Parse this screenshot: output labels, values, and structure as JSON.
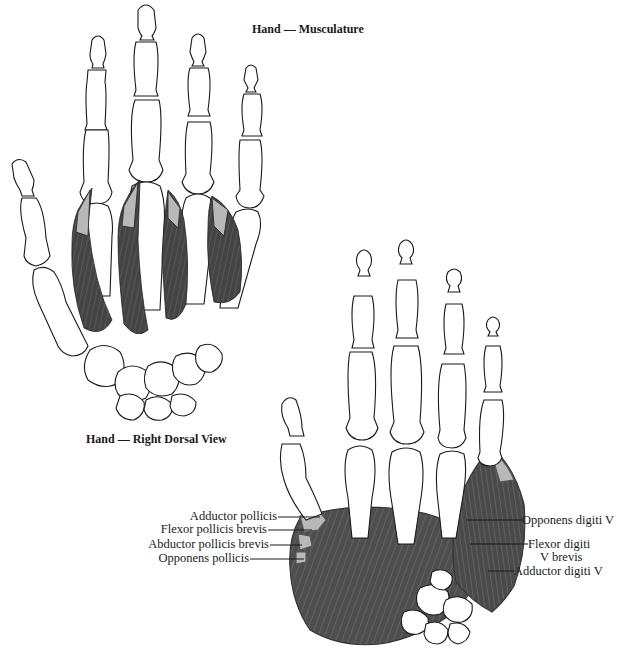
{
  "figure_title": "Hand — Musculature",
  "dorsal_view": {
    "caption": "Hand — Right Dorsal View"
  },
  "palmar_view": {
    "labels_left": [
      {
        "text": "Adductor pollicis"
      },
      {
        "text": "Flexor pollicis brevis"
      },
      {
        "text": "Abductor pollicis brevis"
      },
      {
        "text": "Opponens pollicis"
      }
    ],
    "labels_right": [
      {
        "text": "Opponens digiti V"
      },
      {
        "text": "Flexor digiti"
      },
      {
        "text": "V brevis"
      },
      {
        "text": "Adductor digiti V"
      }
    ]
  },
  "colors": {
    "bone_outline": "#1a1a1a",
    "bone_fill": "#ffffff",
    "muscle": "#555555",
    "muscle_dark": "#3c3c3c",
    "tendon": "#b8b8b8",
    "background": "#ffffff"
  }
}
